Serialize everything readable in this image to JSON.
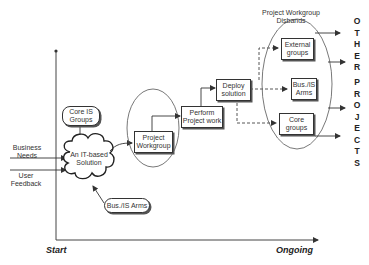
{
  "diagram": {
    "axes": {
      "x_start_label": "Start",
      "x_end_label": "Ongoing"
    },
    "inputs": {
      "business_needs": "Business\nNeeds",
      "user_feedback": "User\nFeedback"
    },
    "nodes": {
      "core_is_groups": "Core IS\nGroups",
      "it_solution": "An IT-based\nSolution",
      "bus_is_arms_input": "Bus./IS Arms",
      "project_workgroup": "Project\nWorkgroup",
      "perform_project_work": "Perform\nProject work",
      "deploy_solution": "Deploy\nsolution",
      "external_groups": "External\ngroups",
      "bus_is_arms_output": "Bus./IS\nArms",
      "core_groups": "Core\ngroups"
    },
    "annotations": {
      "disbands": "Project Workgroup\nDisbands"
    },
    "vertical_text": {
      "other": [
        "O",
        "T",
        "H",
        "E",
        "R"
      ],
      "projects": [
        "P",
        "R",
        "O",
        "J",
        "E",
        "C",
        "T",
        "S"
      ]
    },
    "colors": {
      "line": "#333333",
      "text": "#222222",
      "background": "#ffffff"
    }
  }
}
